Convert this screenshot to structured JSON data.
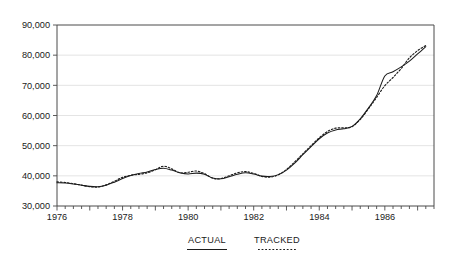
{
  "chart_data": {
    "type": "line",
    "title": "",
    "subtitle": "",
    "xlabel": "",
    "ylabel": "",
    "xlim": [
      1976.0,
      1987.5
    ],
    "ylim": [
      30000,
      90000
    ],
    "grid": true,
    "legend_position": "below-axis",
    "y_ticks": [
      30000,
      40000,
      50000,
      60000,
      70000,
      80000,
      90000
    ],
    "y_tick_labels": [
      "30,000",
      "40,000",
      "50,000",
      "60,000",
      "70,000",
      "80,000",
      "90,000"
    ],
    "x_ticks": [
      1976,
      1977,
      1978,
      1979,
      1980,
      1981,
      1982,
      1983,
      1984,
      1985,
      1986,
      1987
    ],
    "x_tick_labels": [
      "1976",
      "",
      "1978",
      "",
      "1980",
      "",
      "1982",
      "",
      "1984",
      "",
      "1986",
      ""
    ],
    "x_minor_tick_step": 0.25,
    "legend": [
      {
        "name": "ACTUAL",
        "style": "solid"
      },
      {
        "name": "TRACKED",
        "style": "dashed"
      }
    ],
    "x": [
      1976.0,
      1976.25,
      1976.5,
      1976.75,
      1977.0,
      1977.25,
      1977.5,
      1977.75,
      1978.0,
      1978.25,
      1978.5,
      1978.75,
      1979.0,
      1979.25,
      1979.5,
      1979.75,
      1980.0,
      1980.25,
      1980.5,
      1980.75,
      1981.0,
      1981.25,
      1981.5,
      1981.75,
      1982.0,
      1982.25,
      1982.5,
      1982.75,
      1983.0,
      1983.25,
      1983.5,
      1983.75,
      1984.0,
      1984.25,
      1984.5,
      1984.75,
      1985.0,
      1985.25,
      1985.5,
      1985.75,
      1986.0,
      1986.25,
      1986.5,
      1986.75,
      1987.0,
      1987.25
    ],
    "series": [
      {
        "name": "ACTUAL",
        "style": "solid",
        "values": [
          37700,
          37600,
          37300,
          36900,
          36500,
          36400,
          36900,
          37900,
          39100,
          40100,
          40800,
          41300,
          42100,
          42500,
          41900,
          41000,
          40600,
          40900,
          40500,
          39300,
          39000,
          39700,
          40500,
          41000,
          40600,
          39900,
          39800,
          40400,
          41900,
          44200,
          47000,
          49700,
          52300,
          54200,
          55200,
          55600,
          56400,
          58900,
          62500,
          66600,
          73100,
          74500,
          76100,
          78000,
          80400,
          82800
        ]
      },
      {
        "name": "TRACKED",
        "style": "dashed",
        "values": [
          38000,
          37800,
          37400,
          36900,
          36400,
          36300,
          37000,
          38200,
          39500,
          40200,
          40500,
          41000,
          42000,
          43200,
          42300,
          41000,
          41200,
          41600,
          40700,
          39200,
          39100,
          40000,
          41000,
          41400,
          40800,
          39800,
          39600,
          40300,
          42100,
          44600,
          47300,
          50000,
          52600,
          54700,
          55800,
          55900,
          56300,
          58700,
          62200,
          66000,
          69900,
          72600,
          75600,
          79100,
          81500,
          83200
        ]
      }
    ]
  }
}
